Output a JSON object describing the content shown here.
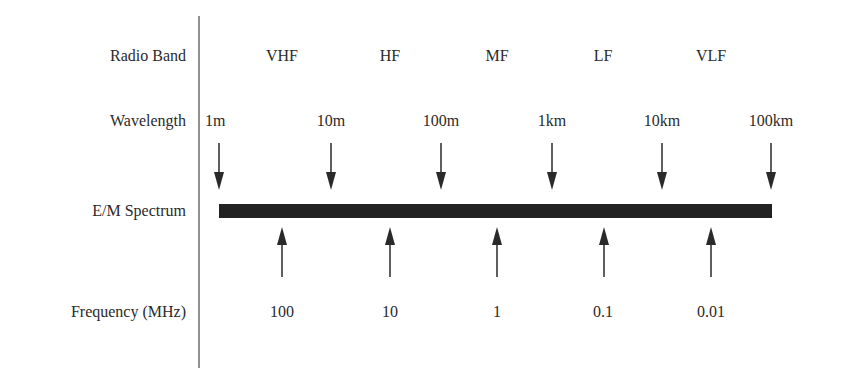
{
  "rows": {
    "radio_band": "Radio Band",
    "wavelength": "Wavelength",
    "spectrum": "E/M Spectrum",
    "frequency": "Frequency (MHz)"
  },
  "bands": [
    "VHF",
    "HF",
    "MF",
    "LF",
    "VLF"
  ],
  "wavelengths": [
    "1m",
    "10m",
    "100m",
    "1km",
    "10km",
    "100km"
  ],
  "frequencies": [
    "100",
    "10",
    "1",
    "0.1",
    "0.01"
  ],
  "colors": {
    "ink": "#2a2a2a",
    "bar": "#222222",
    "background": "#ffffff"
  }
}
